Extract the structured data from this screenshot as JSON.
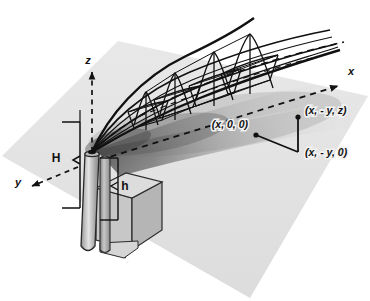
{
  "figure": {
    "background_color": "#ffffff",
    "ground_plane_color": "#e3e3e3",
    "line_color": "#111111",
    "stack_color": "#9d9d9d",
    "building_color": "#cfcfcf",
    "plume_shadow_color": "#4a4a4a"
  },
  "axes": {
    "x": {
      "label": "x",
      "style": "dashed-arrow",
      "direction": "upper-right"
    },
    "y": {
      "label": "y",
      "style": "dashed-arrow",
      "direction": "lower-left"
    },
    "z": {
      "label": "z",
      "style": "dashed-arrow",
      "direction": "up"
    }
  },
  "dimensions": {
    "effective_height": {
      "label": "H",
      "description": "effective plume height"
    },
    "stack_height": {
      "label": "h",
      "description": "physical stack height"
    }
  },
  "coordinates": [
    {
      "name": "origin-downwind-point",
      "label": "(x, 0, 0)"
    },
    {
      "name": "receptor-elevated",
      "label": "(x, - y, z)"
    },
    {
      "name": "receptor-ground",
      "label": "(x, - y, 0)"
    }
  ],
  "plume": {
    "cross_sections": 4,
    "centerline_style": "dashed",
    "envelope_style": "solid"
  }
}
